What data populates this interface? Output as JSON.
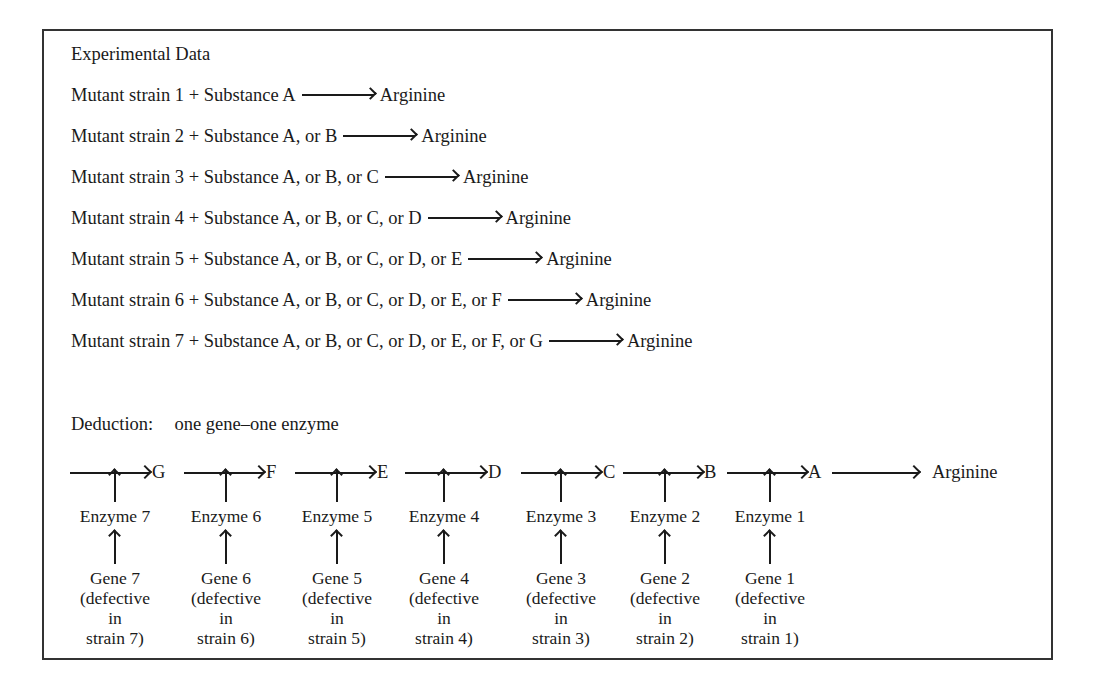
{
  "experimental": {
    "heading": "Experimental Data",
    "rows": [
      {
        "lhs": "Mutant strain 1 + Substance A",
        "rhs": "Arginine"
      },
      {
        "lhs": "Mutant strain 2 + Substance A, or B",
        "rhs": "Arginine"
      },
      {
        "lhs": "Mutant strain 3 + Substance A, or B, or C",
        "rhs": "Arginine"
      },
      {
        "lhs": "Mutant strain 4 + Substance A, or B, or C, or D",
        "rhs": "Arginine"
      },
      {
        "lhs": "Mutant strain 5 + Substance A, or B, or C, or D, or E",
        "rhs": "Arginine"
      },
      {
        "lhs": "Mutant strain 6 + Substance A, or B, or C, or D, or E, or F",
        "rhs": "Arginine"
      },
      {
        "lhs": "Mutant strain 7 + Substance A, or B, or C, or D, or E, or F, or G",
        "rhs": "Arginine"
      }
    ]
  },
  "deduction": {
    "label": "Deduction:",
    "principle": "one gene–one enzyme",
    "pathway": [
      "G",
      "F",
      "E",
      "D",
      "C",
      "B",
      "A",
      "Arginine"
    ],
    "enzymes": [
      "Enzyme 7",
      "Enzyme 6",
      "Enzyme 5",
      "Enzyme 4",
      "Enzyme 3",
      "Enzyme 2",
      "Enzyme 1"
    ],
    "genes": [
      {
        "name": "Gene 7",
        "l1": "(defective",
        "l2": "in",
        "l3": "strain 7)"
      },
      {
        "name": "Gene 6",
        "l1": "(defective",
        "l2": "in",
        "l3": "strain 6)"
      },
      {
        "name": "Gene 5",
        "l1": "(defective",
        "l2": "in",
        "l3": "strain 5)"
      },
      {
        "name": "Gene 4",
        "l1": "(defective",
        "l2": "in",
        "l3": "strain 4)"
      },
      {
        "name": "Gene 3",
        "l1": "(defective",
        "l2": "in",
        "l3": "strain 3)"
      },
      {
        "name": "Gene 2",
        "l1": "(defective",
        "l2": "in",
        "l3": "strain 2)"
      },
      {
        "name": "Gene 1",
        "l1": "(defective",
        "l2": "in",
        "l3": "strain 1)"
      }
    ]
  }
}
